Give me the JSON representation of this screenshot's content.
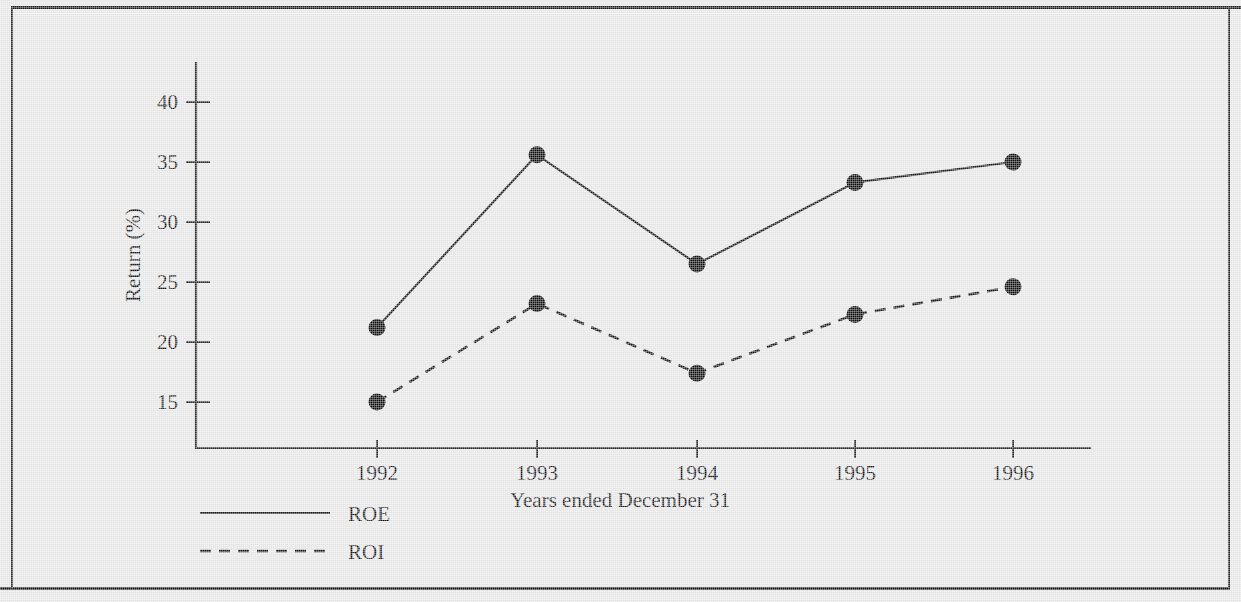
{
  "figure": {
    "background_color": "#e8e8e8",
    "ink_color": "#1a1a1a"
  },
  "chart_data": {
    "type": "line",
    "title": "",
    "xlabel": "Years ended December 31",
    "ylabel": "Return (%)",
    "categories": [
      "1992",
      "1993",
      "1994",
      "1995",
      "1996"
    ],
    "x_tick_labels": [
      "1992",
      "1993",
      "1994",
      "1995",
      "1996"
    ],
    "y_tick_labels": [
      "15",
      "20",
      "25",
      "30",
      "35",
      "40"
    ],
    "y_ticks": [
      15,
      20,
      25,
      30,
      35,
      40
    ],
    "ylim": [
      12.9,
      43.2
    ],
    "grid": false,
    "legend_position": "below-left",
    "series": [
      {
        "name": "ROE",
        "line_style": "solid",
        "marker": "filled-circle",
        "values": [
          21.2,
          35.6,
          26.5,
          33.3,
          35.0
        ]
      },
      {
        "name": "ROI",
        "line_style": "dashed",
        "marker": "filled-circle",
        "values": [
          15.0,
          23.2,
          17.4,
          22.3,
          24.6
        ]
      }
    ]
  },
  "legend": {
    "entries": [
      {
        "label": "ROE",
        "style": "solid"
      },
      {
        "label": "ROI",
        "style": "dashed"
      }
    ]
  }
}
